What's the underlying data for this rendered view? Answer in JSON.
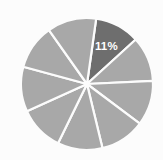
{
  "chart_data": {
    "type": "pie",
    "title": "",
    "subtitle": "",
    "xlabel": "",
    "ylabel": "",
    "grid": false,
    "legend": "none",
    "background_color": "#fcfcfc",
    "divider_color": "#fcfcfc",
    "base_slice_color": "#a8a8a8",
    "highlight_slice_color": "#6e6e6e",
    "label_color": "#ffffff",
    "center": {
      "x": 87,
      "y": 84
    },
    "radius": 66,
    "start_angle_deg": 8,
    "categories": [
      "Slice 1",
      "Slice 2",
      "Slice 3",
      "Slice 4",
      "Slice 5",
      "Slice 6",
      "Slice 7",
      "Slice 8",
      "Slice 9"
    ],
    "values": [
      11,
      11,
      11,
      11,
      11,
      11,
      11,
      11,
      12
    ],
    "slices": [
      {
        "name": "Slice 1",
        "value": 11,
        "color": "#6e6e6e",
        "highlighted": true,
        "label": "11%",
        "show_label": true
      },
      {
        "name": "Slice 2",
        "value": 11,
        "color": "#a8a8a8",
        "highlighted": false,
        "label": "",
        "show_label": false
      },
      {
        "name": "Slice 3",
        "value": 11,
        "color": "#a8a8a8",
        "highlighted": false,
        "label": "",
        "show_label": false
      },
      {
        "name": "Slice 4",
        "value": 11,
        "color": "#a8a8a8",
        "highlighted": false,
        "label": "",
        "show_label": false
      },
      {
        "name": "Slice 5",
        "value": 11,
        "color": "#a8a8a8",
        "highlighted": false,
        "label": "",
        "show_label": false
      },
      {
        "name": "Slice 6",
        "value": 11,
        "color": "#a8a8a8",
        "highlighted": false,
        "label": "",
        "show_label": false
      },
      {
        "name": "Slice 7",
        "value": 11,
        "color": "#a8a8a8",
        "highlighted": false,
        "label": "",
        "show_label": false
      },
      {
        "name": "Slice 8",
        "value": 11,
        "color": "#a8a8a8",
        "highlighted": false,
        "label": "",
        "show_label": false
      },
      {
        "name": "Slice 9",
        "value": 12,
        "color": "#a8a8a8",
        "highlighted": false,
        "label": "",
        "show_label": false
      }
    ],
    "visible_labels": [
      "11%"
    ]
  }
}
